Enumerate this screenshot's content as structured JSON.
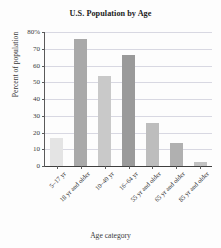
{
  "chart_data": {
    "type": "bar",
    "title": "U.S. Population by Age",
    "xlabel": "Age category",
    "ylabel": "Percent of population",
    "categories": [
      "5–17 yr",
      "18 yr and older",
      "10–49 yr",
      "16–64 yr",
      "55 yr and older",
      "65 yr and older",
      "85 yr and older"
    ],
    "values": [
      17,
      76,
      54,
      66.5,
      25.5,
      14,
      2.5
    ],
    "bar_colors": [
      "#e4e4e4",
      "#a9a9a9",
      "#c9c9c9",
      "#9a9a9a",
      "#bdbdbd",
      "#b0b0b0",
      "#c2c2c2"
    ],
    "ylim": [
      0,
      80
    ],
    "ytick_values": [
      0,
      10,
      20,
      30,
      40,
      50,
      60,
      70,
      80
    ],
    "ytick_labels": [
      "0",
      "10",
      "20",
      "30",
      "40",
      "50",
      "60",
      "70",
      "80%"
    ],
    "grid": true,
    "legend": "none",
    "gridline_color": "#d8d8e2",
    "axis_color": "#5a5a5a"
  }
}
